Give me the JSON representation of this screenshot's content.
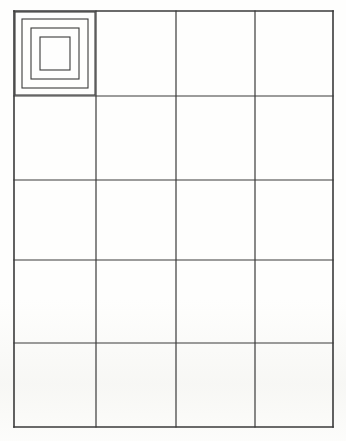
{
  "document": {
    "title": "Nested Squares Grid Worksheet",
    "medium": "scanned paper",
    "page_width": 346,
    "page_height": 441,
    "background_color": "#fefefd",
    "ink_color": "#3a3a3a"
  },
  "grid": {
    "name": "blank-table-grid",
    "columns": 4,
    "rows": 5,
    "total_cells": 20,
    "line_color": "#3a3a3a",
    "line_width": 1.2,
    "outer_border_width": 1.6,
    "x_lines": [
      14,
      96,
      176,
      255,
      333
    ],
    "y_lines": [
      11,
      96,
      180,
      260,
      343,
      427
    ],
    "bounds": {
      "left": 14,
      "top": 11,
      "right": 333,
      "bottom": 427,
      "width": 319,
      "height": 416
    },
    "column_widths": [
      82,
      80,
      79,
      78
    ],
    "row_heights": [
      85,
      84,
      80,
      83,
      84
    ],
    "cells_filled": 1,
    "cells_empty": 19
  },
  "figure": {
    "name": "nested-squares",
    "label": "Nested concentric squares",
    "located_in_cell": {
      "row": 1,
      "column": 1
    },
    "cell_bounds": {
      "left": 14,
      "top": 11,
      "width": 82,
      "height": 85
    },
    "square_count": 4,
    "stroke_color": "#3a3a3a",
    "stroke_width": 1.1,
    "fill": "none",
    "squares": [
      {
        "index": 1,
        "name": "outer-square",
        "x": 15,
        "y": 12,
        "width": 80,
        "height": 83,
        "inset": 0
      },
      {
        "index": 2,
        "name": "second-square",
        "x": 22,
        "y": 19,
        "width": 66,
        "height": 69,
        "inset": 7
      },
      {
        "index": 3,
        "name": "third-square",
        "x": 31,
        "y": 28,
        "width": 48,
        "height": 51,
        "inset": 16
      },
      {
        "index": 4,
        "name": "inner-square",
        "x": 40,
        "y": 37,
        "width": 30,
        "height": 33,
        "inset": 25
      }
    ]
  },
  "chart_data": {
    "type": "table",
    "xlabel": "",
    "ylabel": "",
    "columns": 4,
    "rows": 5,
    "grid": true,
    "legend": "none",
    "column_headers": [
      "",
      "",
      "",
      ""
    ],
    "cells": [
      [
        "nested-squares",
        "",
        "",
        ""
      ],
      [
        "",
        "",
        "",
        ""
      ],
      [
        "",
        "",
        "",
        ""
      ],
      [
        "",
        "",
        "",
        ""
      ],
      [
        "",
        "",
        "",
        ""
      ]
    ],
    "values": [
      1,
      0,
      0,
      0,
      0,
      0,
      0,
      0,
      0,
      0,
      0,
      0,
      0,
      0,
      0,
      0,
      0,
      0,
      0,
      0
    ],
    "categories": [
      "r1c1",
      "r1c2",
      "r1c3",
      "r1c4",
      "r2c1",
      "r2c2",
      "r2c3",
      "r2c4",
      "r3c1",
      "r3c2",
      "r3c3",
      "r3c4",
      "r4c1",
      "r4c2",
      "r4c3",
      "r4c4",
      "r5c1",
      "r5c2",
      "r5c3",
      "r5c4"
    ],
    "annotations": [
      {
        "cell": "r1c1",
        "content": "4 nested concentric squares"
      }
    ]
  }
}
